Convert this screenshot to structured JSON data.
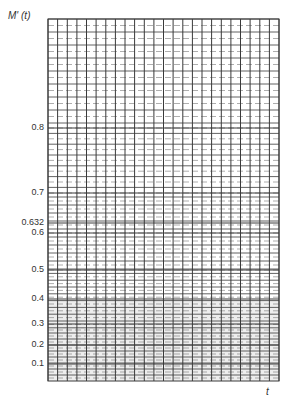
{
  "chart_data": {
    "type": "scatter",
    "title": "",
    "subtitle": "Weibull-type probability plotting paper (blank grid)",
    "xlabel": "t",
    "ylabel": "M' (t)",
    "ylim": [
      0.05,
      0.99
    ],
    "grid": true,
    "legend": null,
    "y_ticks": [
      {
        "label": "0.8",
        "value": 0.8,
        "y": 128
      },
      {
        "label": "0.7",
        "value": 0.7,
        "y": 193
      },
      {
        "label": "0.632",
        "value": 0.632,
        "y": 223
      },
      {
        "label": "0.6",
        "value": 0.6,
        "y": 233
      },
      {
        "label": "0.5",
        "value": 0.5,
        "y": 270
      },
      {
        "label": "0.4",
        "value": 0.4,
        "y": 299
      },
      {
        "label": "0.3",
        "value": 0.3,
        "y": 324
      },
      {
        "label": "0.2",
        "value": 0.2,
        "y": 345
      },
      {
        "label": "0.1",
        "value": 0.1,
        "y": 364
      }
    ],
    "x_ticks": [],
    "series": []
  },
  "plot_area": {
    "left": 48,
    "top": 19,
    "right": 279,
    "bottom": 381,
    "columns": 24
  },
  "grid_bands": [
    {
      "from": 19,
      "to": 128,
      "step": 6.5
    },
    {
      "from": 128,
      "to": 193,
      "step": 5.4
    },
    {
      "from": 193,
      "to": 270,
      "step": 4.0
    },
    {
      "from": 270,
      "to": 330,
      "step": 3.4
    },
    {
      "from": 330,
      "to": 381,
      "step": 3.0
    }
  ],
  "colors": {
    "grid": "#3a3a3a",
    "grid_minor": "#777777",
    "shade": "#d8d8d8"
  },
  "labels": {
    "y_title": "M' (t)",
    "x_title": "t"
  }
}
